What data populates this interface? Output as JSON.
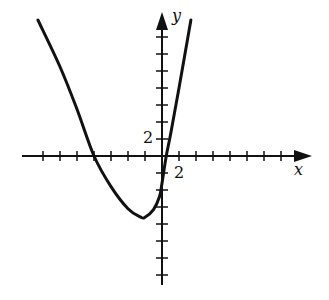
{
  "chart_data": {
    "type": "line",
    "title": "",
    "xlabel": "x",
    "ylabel": "y",
    "tick_spacing": 2,
    "x_tick_label": "2",
    "y_tick_label": "2",
    "xlim": [
      -16,
      16
    ],
    "ylim": [
      -14,
      16
    ],
    "grid": false,
    "series": [
      {
        "name": "curve",
        "x": [
          -14.6,
          -12,
          -10,
          -8,
          -6,
          -4,
          -2.5,
          -2,
          -1,
          -0.3,
          0,
          0.5,
          1,
          2,
          3.4
        ],
        "y": [
          16,
          10.5,
          5.5,
          0,
          -3.6,
          -6.2,
          -7.2,
          -7.2,
          -6.3,
          -4.8,
          -3.2,
          0,
          2.5,
          8,
          16
        ]
      }
    ]
  },
  "labels": {
    "x_axis": "x",
    "y_axis": "y",
    "x_tick": "2",
    "y_tick": "2"
  },
  "colors": {
    "line": "#111111",
    "background": "#ffffff"
  }
}
